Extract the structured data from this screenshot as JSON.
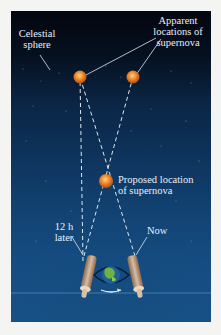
{
  "diagram": {
    "labels": {
      "celestial_sphere": [
        "Celestial",
        "sphere"
      ],
      "apparent_locations": [
        "Apparent",
        "locations of",
        "supernova"
      ],
      "proposed_location": [
        "Proposed location",
        "of supernova"
      ],
      "twelve_h_later": [
        "12 h",
        "later"
      ],
      "now": [
        "Now"
      ]
    },
    "objects": {
      "apparent_supernova_left": {
        "x": 80,
        "y": 77
      },
      "apparent_supernova_right": {
        "x": 133,
        "y": 77
      },
      "proposed_supernova": {
        "x": 106,
        "y": 181
      },
      "earth": {
        "x": 104,
        "y": 273
      }
    },
    "colors": {
      "sky_top": "#03060f",
      "sky_bottom": "#1a5b94",
      "supernova": "#e8822c",
      "dashed_line": "#dfe6ee",
      "telescope": "#c9a789",
      "earth_land": "#6fb33f",
      "earth_ocean": "#1f5f9a"
    }
  }
}
